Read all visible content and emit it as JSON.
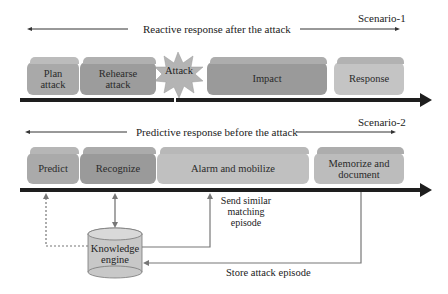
{
  "scenario1": {
    "title": "Reactive response after the attack",
    "label": "Scenario-1",
    "stages": [
      {
        "label": "Plan\nattack",
        "color": "#a9a9a9"
      },
      {
        "label": "Rehearse\nattack",
        "color": "#9c9c9c"
      },
      {
        "label": "Attack",
        "color": "#b4b4b4"
      },
      {
        "label": "Impact",
        "color": "#9a9a9a"
      },
      {
        "label": "Response",
        "color": "#c4c4c4"
      }
    ]
  },
  "scenario2": {
    "title": "Predictive response before the attack",
    "label": "Scenario-2",
    "stages": [
      {
        "label": "Predict",
        "color": "#aaaaaa"
      },
      {
        "label": "Recognize",
        "color": "#9a9a9a"
      },
      {
        "label": "Alarm and mobilize",
        "color": "#c0c0c0"
      },
      {
        "label": "Memorize and\ndocument",
        "color": "#bcbcbc"
      }
    ]
  },
  "knowledge_engine": {
    "label": "Knowledge\nengine",
    "color": "#c8c8c8"
  },
  "annotations": {
    "send_episode": "Send similar\nmatching\nepisode",
    "store_episode": "Store attack episode"
  },
  "colors": {
    "timeline": "#1e1e1e",
    "connector": "#707070"
  }
}
